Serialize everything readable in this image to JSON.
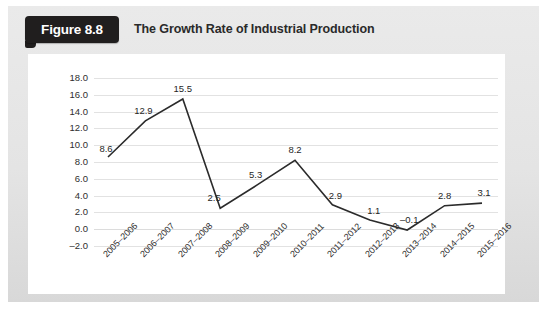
{
  "figure": {
    "tag_label": "Figure 8.8",
    "title": "The Growth Rate of Industrial Production",
    "source_note": ""
  },
  "colors": {
    "tag_background": "#201e1e",
    "tag_text": "#ffffff",
    "panel_background": "#ffffff",
    "frame_background": "#e8e8e8",
    "series_line": "#2b2b2b",
    "gridline": "#e2e2e2",
    "axis_text": "#2e2e2e"
  },
  "chart_data": {
    "type": "line",
    "title": "The Growth Rate of Industrial Production",
    "xlabel": "",
    "ylabel": "",
    "ylim": [
      -2.0,
      18.0
    ],
    "ytick_step": 2.0,
    "ytick_labels": [
      "18.0",
      "16.0",
      "14.0",
      "12.0",
      "10.0",
      "8.0",
      "6.0",
      "4.0",
      "2.0",
      "0.0",
      "-2.0"
    ],
    "ytick_values": [
      18.0,
      16.0,
      14.0,
      12.0,
      10.0,
      8.0,
      6.0,
      4.0,
      2.0,
      0.0,
      -2.0
    ],
    "grid": true,
    "legend": false,
    "categories": [
      "2005-2006",
      "2006-2007",
      "2007-2008",
      "2008-2009",
      "2009-2010",
      "2010-2011",
      "2011-2012",
      "2012-2013",
      "2013-2014",
      "2014-2015",
      "2015-2016"
    ],
    "values": [
      8.6,
      12.9,
      15.5,
      2.5,
      5.3,
      8.2,
      2.9,
      1.1,
      -0.1,
      2.8,
      3.1
    ],
    "point_labels": [
      "8.6",
      "12.9",
      "15.5",
      "2.5",
      "5.3",
      "8.2",
      "2.9",
      "1.1",
      "-0.1",
      "2.8",
      "3.1"
    ],
    "label_offsets_px": [
      {
        "dx": -2,
        "dy": -14
      },
      {
        "dx": -2,
        "dy": -16
      },
      {
        "dx": 0,
        "dy": -16
      },
      {
        "dx": -6,
        "dy": -16
      },
      {
        "dx": -2,
        "dy": -16
      },
      {
        "dx": 0,
        "dy": -16
      },
      {
        "dx": 3,
        "dy": -15
      },
      {
        "dx": 4,
        "dy": -15
      },
      {
        "dx": 2,
        "dy": -16
      },
      {
        "dx": 0,
        "dy": -16
      },
      {
        "dx": 2,
        "dy": -16
      }
    ]
  }
}
